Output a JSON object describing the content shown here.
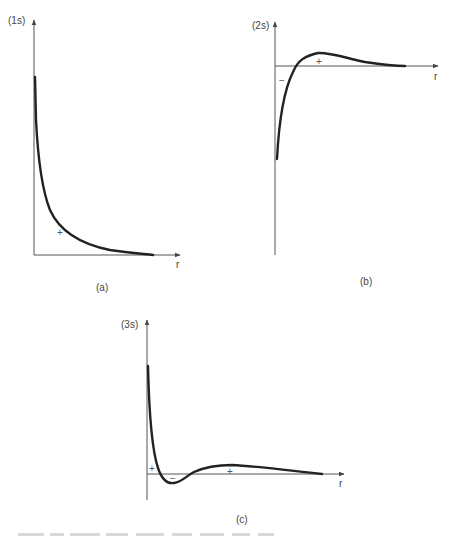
{
  "figure": {
    "panels": [
      {
        "id": "a",
        "y_label": "(1s)",
        "x_label": "r",
        "caption": "(a)",
        "signs": [
          "+"
        ]
      },
      {
        "id": "b",
        "y_label": "(2s)",
        "x_label": "r",
        "caption": "(b)",
        "signs": [
          "−",
          "+"
        ]
      },
      {
        "id": "c",
        "y_label": "(3s)",
        "x_label": "r",
        "caption": "(c)",
        "signs": [
          "+",
          "−",
          "+"
        ]
      }
    ]
  }
}
